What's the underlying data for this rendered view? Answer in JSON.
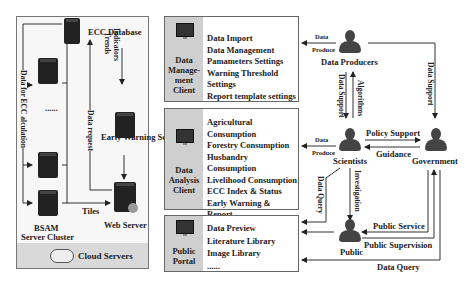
{
  "cloud": {
    "footer_label": "Cloud Servers",
    "ecc_database": "ECC Database",
    "early_warning_server": "Early Warning Server",
    "web_server": "Web Server",
    "bsam_cluster_line1": "BSAM",
    "bsam_cluster_line2": "Server Cluster",
    "ellipsis": "......",
    "arrows": {
      "trends_indicators_line1": "Trends",
      "trends_indicators_line2": "Indicators",
      "data_request": "Data request",
      "data_for_ecc": "Data for ECC alculation",
      "tiles": "Tiles"
    }
  },
  "clients": [
    {
      "name_lines": [
        "Data",
        "Manage-",
        "ment",
        "Client"
      ],
      "items": [
        "Data Import",
        "Data Management",
        "Pamameters Settings",
        "Warning Threshold Settings",
        "Report template settings",
        "......"
      ]
    },
    {
      "name_lines": [
        "Data",
        "Analysis",
        "Client"
      ],
      "items": [
        "Agricultural Consumption",
        "Forestry Consumption",
        "Husbandry Consumption",
        "Livelihood Consumption",
        "ECC Index & Status",
        "Early Warning & Report",
        "......"
      ]
    },
    {
      "name_lines": [
        "Public",
        "Portal"
      ],
      "items": [
        "Data Preview",
        "Literature Library",
        "Image Library",
        "......"
      ]
    }
  ],
  "actors": {
    "data_producers": "Data Producers",
    "scientists": "Scientists",
    "government": "Government",
    "public": "Public"
  },
  "relations": {
    "data_produce_1_line1": "Data",
    "data_produce_1_line2": "Produce",
    "data_produce_2_line1": "Data",
    "data_produce_2_line2": "Produce",
    "data_support_producers_scientists": "Data Support",
    "algorithms": "Algorithms",
    "data_support_producers_government": "Data Support",
    "policy_support": "Policy Support",
    "guidance": "Guidance",
    "data_query_scientists": "Data Query",
    "investigation": "Investigation",
    "public_service": "Public Service",
    "public_supervision": "Public Supervision",
    "data_query_government": "Data Query"
  }
}
